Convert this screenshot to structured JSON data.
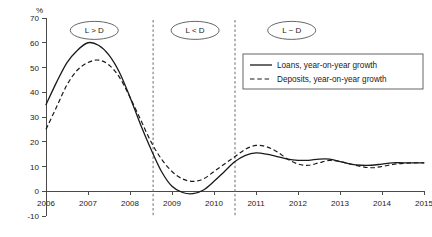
{
  "chart_data": {
    "type": "line",
    "title": "",
    "subtitle": "",
    "xlabel": "",
    "ylabel": "",
    "unit_label": "%",
    "xlim": [
      2006,
      2015
    ],
    "ylim": [
      -10,
      70
    ],
    "ytick_step": 10,
    "grid": false,
    "legend_position": "top-right",
    "xticks": [
      "2006",
      "2007",
      "2008",
      "2009",
      "2010",
      "2011",
      "2012",
      "2013",
      "2014",
      "2015"
    ],
    "yticks": [
      "70",
      "60",
      "50",
      "40",
      "30",
      "20",
      "10",
      "0",
      "-10"
    ],
    "x": [
      2006.0,
      2006.25,
      2006.5,
      2006.75,
      2007.0,
      2007.25,
      2007.5,
      2007.75,
      2008.0,
      2008.25,
      2008.5,
      2008.75,
      2009.0,
      2009.25,
      2009.5,
      2009.75,
      2010.0,
      2010.25,
      2010.5,
      2010.75,
      2011.0,
      2011.25,
      2011.5,
      2011.75,
      2012.0,
      2012.25,
      2012.5,
      2012.75,
      2013.0,
      2013.25,
      2013.5,
      2013.75,
      2014.0,
      2014.25,
      2014.5,
      2014.75,
      2015.0
    ],
    "series": [
      {
        "name": "Loans, year-on-year growth",
        "style": "solid",
        "color": "#1a1a1a",
        "values": [
          35,
          44,
          52,
          57,
          60,
          59,
          55,
          48,
          38,
          27,
          17,
          8,
          2,
          -0.5,
          -1,
          0.5,
          4,
          8,
          12,
          14.5,
          15.5,
          15,
          14,
          13,
          12.5,
          12.5,
          13,
          13,
          12,
          11,
          10.5,
          10.5,
          11,
          11.5,
          11.5,
          11.5,
          11.5
        ]
      },
      {
        "name": "Deposits, year-on-year growth",
        "style": "dashed",
        "color": "#1a1a1a",
        "values": [
          25,
          34,
          43,
          49,
          52,
          53,
          51,
          46,
          38,
          29,
          20,
          13,
          8,
          5,
          4,
          5,
          8,
          11,
          14,
          17,
          18.5,
          18,
          16,
          13,
          11,
          10.5,
          11.5,
          12.5,
          12,
          11,
          10,
          9.5,
          10,
          10.8,
          11.3,
          11.5,
          11.5
        ]
      }
    ],
    "annotations": [
      {
        "text": "L > D",
        "x": 2007.15,
        "y": 65
      },
      {
        "text": "L < D",
        "x": 2009.55,
        "y": 65
      },
      {
        "text": "L ~ D",
        "x": 2011.85,
        "y": 65
      }
    ],
    "dividers": [
      {
        "x": 2008.55
      },
      {
        "x": 2010.5
      }
    ]
  },
  "legend": {
    "entries": [
      {
        "label": "Loans, year-on-year growth",
        "style": "solid"
      },
      {
        "label": "Deposits, year-on-year growth",
        "style": "dashed"
      }
    ]
  }
}
